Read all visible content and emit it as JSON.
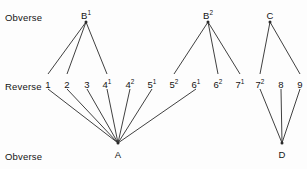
{
  "figure": {
    "type": "die-link-diagram",
    "background_color": "#fdfdfd",
    "line_color": "#2a2a2a",
    "text_color": "#141414"
  },
  "row_labels": {
    "top": "Obverse",
    "middle": "Reverse",
    "bottom": "Obverse"
  },
  "obverse_top": [
    {
      "id": "B1",
      "label": "B",
      "sup": "1",
      "x": 86,
      "y": 17
    },
    {
      "id": "B2",
      "label": "B",
      "sup": "2",
      "x": 208,
      "y": 17
    },
    {
      "id": "C",
      "label": "C",
      "sup": "",
      "x": 270,
      "y": 17
    }
  ],
  "reverse": [
    {
      "id": "1",
      "label": "1",
      "sup": "",
      "x": 48,
      "y": 86
    },
    {
      "id": "2",
      "label": "2",
      "sup": "",
      "x": 67,
      "y": 86
    },
    {
      "id": "3",
      "label": "3",
      "sup": "",
      "x": 87,
      "y": 86
    },
    {
      "id": "41",
      "label": "4",
      "sup": "1",
      "x": 107,
      "y": 86
    },
    {
      "id": "42",
      "label": "4",
      "sup": "2",
      "x": 130,
      "y": 86
    },
    {
      "id": "51",
      "label": "5",
      "sup": "1",
      "x": 152,
      "y": 86
    },
    {
      "id": "52",
      "label": "5",
      "sup": "2",
      "x": 174,
      "y": 86
    },
    {
      "id": "61",
      "label": "6",
      "sup": "1",
      "x": 196,
      "y": 86
    },
    {
      "id": "62",
      "label": "6",
      "sup": "2",
      "x": 218,
      "y": 86
    },
    {
      "id": "71",
      "label": "7",
      "sup": "1",
      "x": 240,
      "y": 86
    },
    {
      "id": "72",
      "label": "7",
      "sup": "2",
      "x": 260,
      "y": 86
    },
    {
      "id": "8",
      "label": "8",
      "sup": "",
      "x": 281,
      "y": 86
    },
    {
      "id": "9",
      "label": "9",
      "sup": "",
      "x": 300,
      "y": 86
    }
  ],
  "obverse_bottom": [
    {
      "id": "A",
      "label": "A",
      "sup": "",
      "x": 118,
      "y": 156
    },
    {
      "id": "D",
      "label": "D",
      "sup": "",
      "x": 282,
      "y": 156
    }
  ],
  "edges": [
    {
      "from": "B1",
      "to": "1"
    },
    {
      "from": "B1",
      "to": "2"
    },
    {
      "from": "B1",
      "to": "41"
    },
    {
      "from": "B2",
      "to": "52"
    },
    {
      "from": "B2",
      "to": "62"
    },
    {
      "from": "B2",
      "to": "71"
    },
    {
      "from": "C",
      "to": "72"
    },
    {
      "from": "C",
      "to": "9"
    },
    {
      "from": "A",
      "to": "1"
    },
    {
      "from": "A",
      "to": "2"
    },
    {
      "from": "A",
      "to": "3"
    },
    {
      "from": "A",
      "to": "41"
    },
    {
      "from": "A",
      "to": "42"
    },
    {
      "from": "A",
      "to": "51"
    },
    {
      "from": "A",
      "to": "61"
    },
    {
      "from": "D",
      "to": "72"
    },
    {
      "from": "D",
      "to": "8"
    },
    {
      "from": "D",
      "to": "9"
    }
  ],
  "row_label_positions": {
    "top": {
      "x": 5,
      "y": 12
    },
    "middle": {
      "x": 5,
      "y": 81
    },
    "bottom": {
      "x": 5,
      "y": 151
    }
  }
}
